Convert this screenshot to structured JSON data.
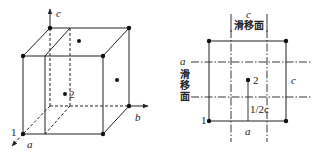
{
  "figure": {
    "left_diagram": {
      "description": "Unit cell (cube) with axes a, b, c; slip plane shown inside cell",
      "axis_labels": {
        "a": "a",
        "b": "b",
        "c": "c"
      },
      "atom_labels": {
        "atom1": "1",
        "atom2": "2"
      }
    },
    "right_diagram": {
      "description": "Projection of cell with slip planes marked by dash-dot lines",
      "top_axis_label": "c",
      "top_slip_plane_label": "滑移面",
      "left_axis_label": "a",
      "left_slip_plane_chars": [
        "滑",
        "移",
        "面"
      ],
      "right_edge_label": "c",
      "bottom_edge_label": "a",
      "offset_label": "1/2c",
      "atom_labels": {
        "atom1": "1",
        "atom2": "2"
      }
    }
  },
  "colors": {
    "line": "#222222",
    "background": "#ffffff"
  }
}
